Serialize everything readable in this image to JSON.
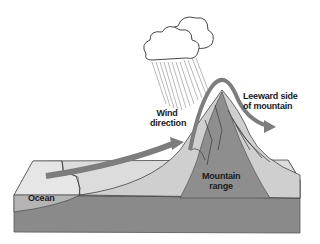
{
  "diagram": {
    "topic": "Orographic precipitation",
    "labels": {
      "wind_direction": [
        "Wind",
        "direction"
      ],
      "leeward_side": [
        "Leeward side",
        "of mountain"
      ],
      "mountain_range": [
        "Mountain",
        "range"
      ],
      "ocean": "Ocean"
    },
    "elements": [
      "rain-cloud",
      "rain-streaks",
      "air-flow-arrow",
      "mountain",
      "land-block",
      "ocean-layer"
    ],
    "colors": {
      "front_face": "#8a8a8a",
      "top_surface": "#dcdcdc",
      "ocean": "#b4b4b4",
      "air_flow": "#7d7d7d",
      "mountain": "#a8a8a8",
      "outline": "#3a3a3a",
      "cloud": "#ffffff"
    }
  }
}
